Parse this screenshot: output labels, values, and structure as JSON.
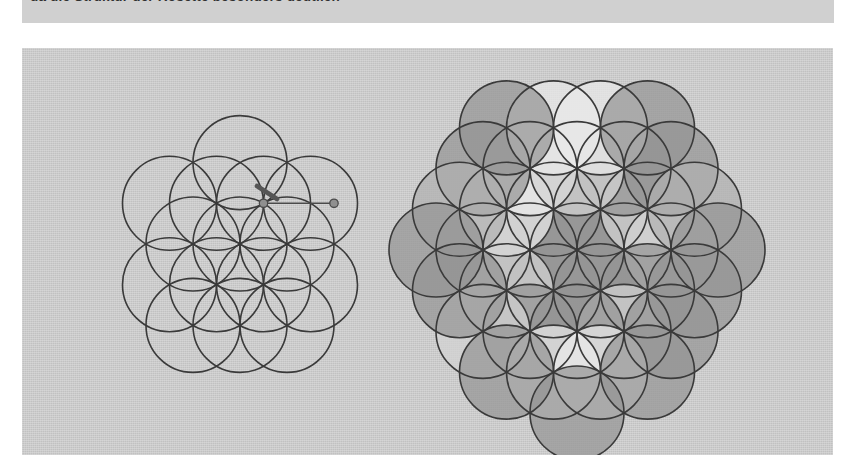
{
  "page": {
    "background_color": "#ffffff",
    "width": 854,
    "height": 468
  },
  "caption": {
    "text": "da die Struktur der Rosette besonders deutlich",
    "strip_color": "#d0d0d0",
    "text_color": "#303030",
    "clipped": "true"
  },
  "figure_panel": {
    "background_color": "#c9c9c9",
    "ink_color": "#3a3a3a"
  },
  "palette": {
    "paper": "#c9c9c9",
    "very_light": "#e9e9e9",
    "light": "#d2d2d2",
    "medium": "#b0b0b0",
    "dark": "#949494",
    "ink": "#3a3a3a",
    "compass_metal": "#8f8f8f"
  },
  "left_figure": {
    "name": "seed-of-life-with-compass",
    "radius": 47,
    "center": [
      145,
      146
    ],
    "circles": [
      {
        "cx": 145,
        "cy": 146
      },
      {
        "cx": 192,
        "cy": 146
      },
      {
        "cx": 98,
        "cy": 146
      },
      {
        "cx": 168.5,
        "cy": 105.3
      },
      {
        "cx": 121.5,
        "cy": 105.3
      },
      {
        "cx": 168.5,
        "cy": 186.7
      },
      {
        "cx": 121.5,
        "cy": 186.7
      },
      {
        "cx": 215.5,
        "cy": 105.3
      },
      {
        "cx": 74.5,
        "cy": 105.3
      },
      {
        "cx": 215.5,
        "cy": 186.7
      },
      {
        "cx": 74.5,
        "cy": 186.7
      },
      {
        "cx": 145,
        "cy": 64.6
      },
      {
        "cx": 145,
        "cy": 227.4
      },
      {
        "cx": 192,
        "cy": 227.4
      },
      {
        "cx": 98,
        "cy": 227.4
      }
    ],
    "compass": {
      "pivot": [
        168.5,
        105.3
      ],
      "pencil_tip": [
        239,
        105.3
      ],
      "leg_from": [
        168.5,
        105.3
      ],
      "leg_to": [
        239,
        105.3
      ],
      "pencil_from": [
        162,
        88
      ],
      "pencil_to": [
        182,
        101
      ]
    }
  },
  "right_figure": {
    "name": "flower-of-life-shaded",
    "radius": 47,
    "center": [
      215,
      200
    ],
    "shade_keys": [
      "dark",
      "light",
      "very_light",
      "medium"
    ],
    "circles": [
      {
        "cx": 215,
        "cy": 200,
        "shade": "medium"
      },
      {
        "cx": 262,
        "cy": 200,
        "shade": "dark"
      },
      {
        "cx": 168,
        "cy": 200,
        "shade": "dark"
      },
      {
        "cx": 238.5,
        "cy": 159.3,
        "shade": "dark"
      },
      {
        "cx": 191.5,
        "cy": 159.3,
        "shade": "dark"
      },
      {
        "cx": 238.5,
        "cy": 240.7,
        "shade": "dark"
      },
      {
        "cx": 191.5,
        "cy": 240.7,
        "shade": "dark"
      },
      {
        "cx": 309,
        "cy": 200,
        "shade": "light"
      },
      {
        "cx": 121,
        "cy": 200,
        "shade": "dark"
      },
      {
        "cx": 285.5,
        "cy": 159.3,
        "shade": "light"
      },
      {
        "cx": 144.5,
        "cy": 159.3,
        "shade": "very_light"
      },
      {
        "cx": 285.5,
        "cy": 240.7,
        "shade": "dark"
      },
      {
        "cx": 144.5,
        "cy": 240.7,
        "shade": "light"
      },
      {
        "cx": 262,
        "cy": 118.6,
        "shade": "dark"
      },
      {
        "cx": 168,
        "cy": 118.6,
        "shade": "very_light"
      },
      {
        "cx": 262,
        "cy": 281.4,
        "shade": "light"
      },
      {
        "cx": 168,
        "cy": 281.4,
        "shade": "dark"
      },
      {
        "cx": 215,
        "cy": 118.6,
        "shade": "light"
      },
      {
        "cx": 215,
        "cy": 281.4,
        "shade": "dark"
      },
      {
        "cx": 309,
        "cy": 118.6,
        "shade": "dark"
      },
      {
        "cx": 121,
        "cy": 118.6,
        "shade": "dark"
      },
      {
        "cx": 309,
        "cy": 281.4,
        "shade": "dark"
      },
      {
        "cx": 121,
        "cy": 281.4,
        "shade": "light"
      },
      {
        "cx": 332.5,
        "cy": 159.3,
        "shade": "medium"
      },
      {
        "cx": 97.5,
        "cy": 159.3,
        "shade": "medium"
      },
      {
        "cx": 332.5,
        "cy": 240.7,
        "shade": "dark"
      },
      {
        "cx": 97.5,
        "cy": 240.7,
        "shade": "dark"
      },
      {
        "cx": 238.5,
        "cy": 77.9,
        "shade": "very_light"
      },
      {
        "cx": 191.5,
        "cy": 77.9,
        "shade": "very_light"
      },
      {
        "cx": 285.5,
        "cy": 77.9,
        "shade": "dark"
      },
      {
        "cx": 144.5,
        "cy": 77.9,
        "shade": "dark"
      },
      {
        "cx": 238.5,
        "cy": 322.1,
        "shade": "very_light"
      },
      {
        "cx": 191.5,
        "cy": 322.1,
        "shade": "very_light"
      },
      {
        "cx": 285.5,
        "cy": 322.1,
        "shade": "dark"
      },
      {
        "cx": 144.5,
        "cy": 322.1,
        "shade": "dark"
      },
      {
        "cx": 215,
        "cy": 363,
        "shade": "dark"
      },
      {
        "cx": 356,
        "cy": 200,
        "shade": "dark"
      },
      {
        "cx": 74,
        "cy": 200,
        "shade": "dark"
      }
    ]
  }
}
